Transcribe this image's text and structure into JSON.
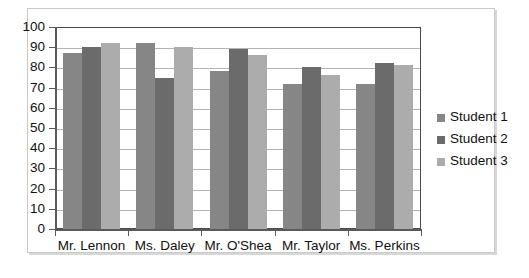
{
  "chart_data": {
    "type": "bar",
    "title": "",
    "subtitle": "",
    "xlabel": "",
    "ylabel": "",
    "ylim": [
      0,
      100
    ],
    "ytick_step": 10,
    "yticks": [
      100,
      90,
      80,
      70,
      60,
      50,
      40,
      30,
      20,
      10,
      0
    ],
    "grid": true,
    "legend_position": "right",
    "categories": [
      "Mr. Lennon",
      "Ms. Daley",
      "Mr. O'Shea",
      "Mr. Taylor",
      "Ms. Perkins"
    ],
    "series": [
      {
        "name": "Student 1",
        "color": "#868686",
        "values": [
          87,
          92,
          78,
          72,
          72
        ]
      },
      {
        "name": "Student 2",
        "color": "#6b6b6b",
        "values": [
          90,
          75,
          89,
          80,
          82
        ]
      },
      {
        "name": "Student 3",
        "color": "#acacac",
        "values": [
          92,
          90,
          86,
          76,
          81
        ]
      }
    ]
  },
  "legend": {
    "items": [
      {
        "label": "Student 1",
        "color": "#868686"
      },
      {
        "label": "Student 2",
        "color": "#6b6b6b"
      },
      {
        "label": "Student 3",
        "color": "#acacac"
      }
    ]
  },
  "colors": {
    "plot_border": "#4a4a4a",
    "gridline": "#b3b3b3",
    "outer_frame": "#c9c9c9",
    "axis": "#5a5a5a",
    "text": "#111111",
    "background": "#ffffff"
  }
}
